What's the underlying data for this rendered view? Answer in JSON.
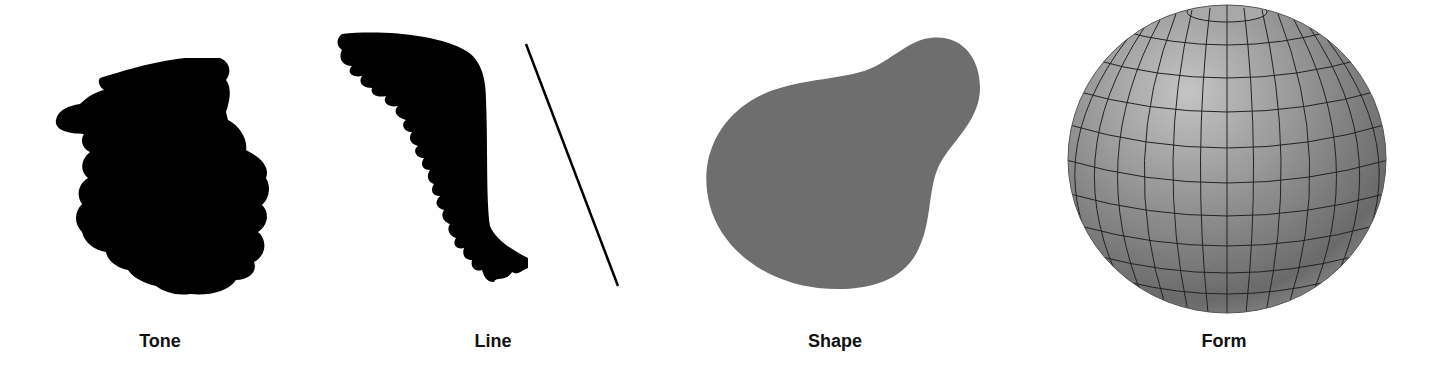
{
  "figure": {
    "elements": [
      {
        "id": "tone",
        "label": "Tone",
        "description": "Black scribbled tonal patch",
        "color": "#000000"
      },
      {
        "id": "line",
        "label": "Line",
        "description": "Black wavy-edged brush stroke beside a thin straight diagonal line",
        "color": "#000000"
      },
      {
        "id": "shape",
        "label": "Shape",
        "description": "Flat gray pear-like blob",
        "color": "#6e6e6e"
      },
      {
        "id": "form",
        "label": "Form",
        "description": "Shaded 3D gray sphere with latitude/longitude grid lines",
        "color": "#8a8a8a"
      }
    ]
  }
}
